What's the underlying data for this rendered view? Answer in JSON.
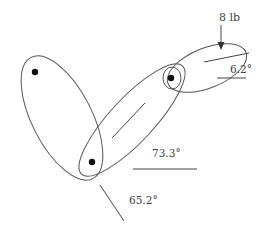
{
  "figure": {
    "colors": {
      "stroke": "#555555",
      "joint": "#111111",
      "text": "#444444"
    }
  },
  "load": {
    "label": "8 lb"
  },
  "angles": {
    "segment_right": "6.2°",
    "segment_middle": "73.3°",
    "segment_left": "65.2°"
  }
}
